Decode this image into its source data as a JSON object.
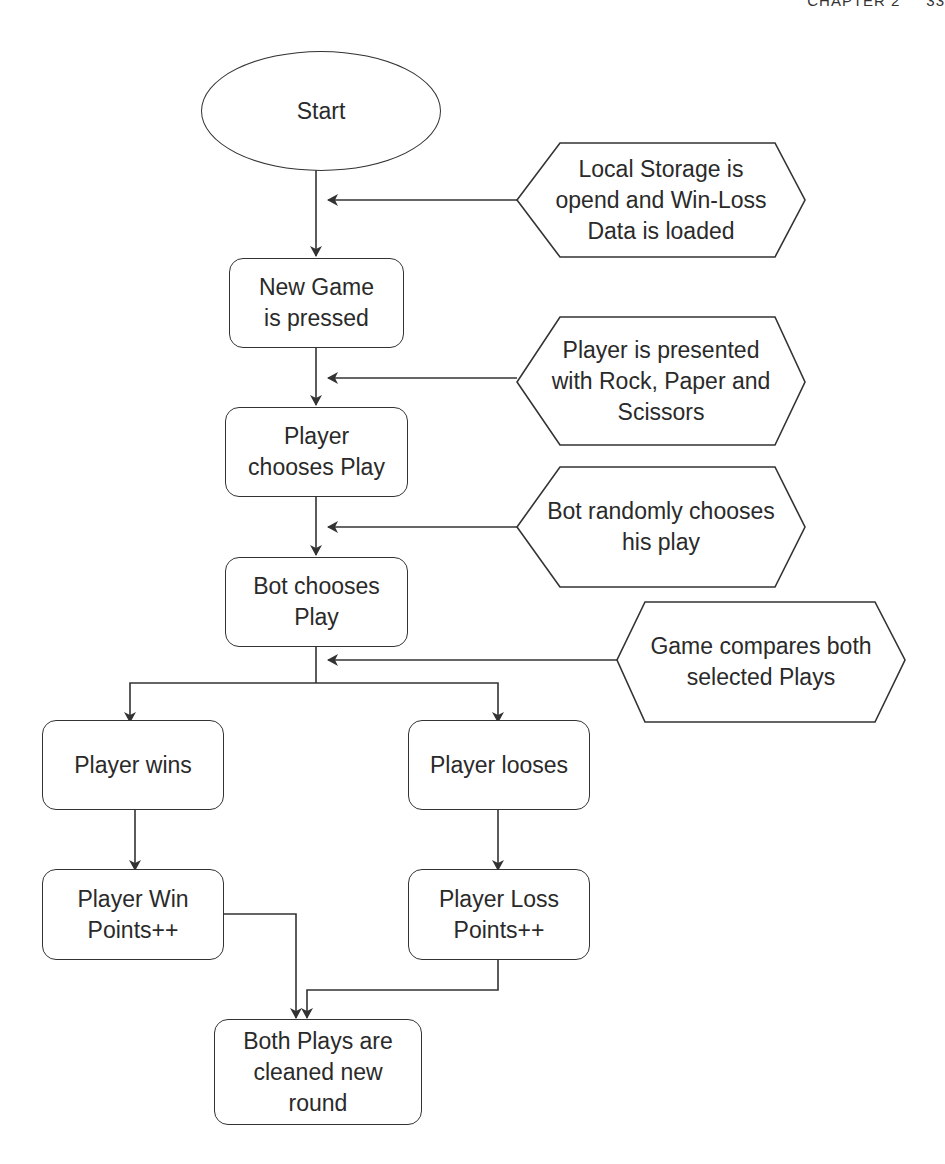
{
  "header": {
    "text": "CHAPTER 2     33"
  },
  "colors": {
    "stroke": "#333333",
    "text": "#2a2a2a",
    "background": "#ffffff"
  },
  "diagram": {
    "type": "flowchart",
    "nodes": {
      "start": {
        "shape": "ellipse",
        "label": "Start"
      },
      "new_game": {
        "shape": "rounded-rect",
        "label": "New Game\nis pressed"
      },
      "player_chooses": {
        "shape": "rounded-rect",
        "label": "Player\nchooses Play"
      },
      "bot_chooses": {
        "shape": "rounded-rect",
        "label": "Bot chooses\nPlay"
      },
      "player_wins": {
        "shape": "rounded-rect",
        "label": "Player wins"
      },
      "player_looses": {
        "shape": "rounded-rect",
        "label": "Player looses"
      },
      "win_points": {
        "shape": "rounded-rect",
        "label": "Player Win\nPoints++"
      },
      "loss_points": {
        "shape": "rounded-rect",
        "label": "Player Loss\nPoints++"
      },
      "clean_round": {
        "shape": "rounded-rect",
        "label": "Both Plays are\ncleaned new\nround"
      }
    },
    "annotations": {
      "local_storage": {
        "shape": "hexagon",
        "label": "Local Storage is\nopend and Win-Loss\nData is loaded"
      },
      "presented": {
        "shape": "hexagon",
        "label": "Player is presented\nwith Rock, Paper and\nScissors"
      },
      "bot_random": {
        "shape": "hexagon",
        "label": "Bot randomly chooses\nhis play"
      },
      "compare": {
        "shape": "hexagon",
        "label": "Game compares both\nselected Plays"
      }
    },
    "edges": [
      {
        "from": "start",
        "to": "new_game"
      },
      {
        "from": "local_storage",
        "to": "start->new_game"
      },
      {
        "from": "new_game",
        "to": "player_chooses"
      },
      {
        "from": "presented",
        "to": "new_game->player_chooses"
      },
      {
        "from": "player_chooses",
        "to": "bot_chooses"
      },
      {
        "from": "bot_random",
        "to": "player_chooses->bot_chooses"
      },
      {
        "from": "bot_chooses",
        "to": "player_wins"
      },
      {
        "from": "bot_chooses",
        "to": "player_looses"
      },
      {
        "from": "compare",
        "to": "bot_chooses->branch"
      },
      {
        "from": "player_wins",
        "to": "win_points"
      },
      {
        "from": "player_looses",
        "to": "loss_points"
      },
      {
        "from": "win_points",
        "to": "clean_round"
      },
      {
        "from": "loss_points",
        "to": "clean_round"
      }
    ]
  }
}
